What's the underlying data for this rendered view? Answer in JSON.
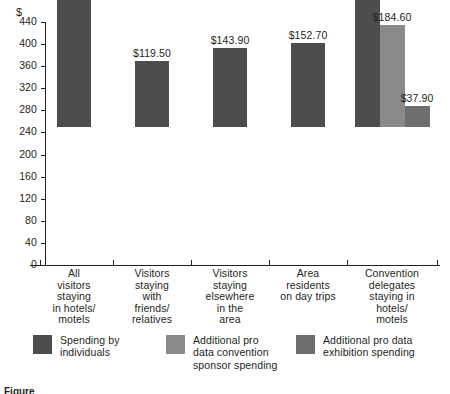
{
  "chart_data": {
    "type": "bar",
    "title": "",
    "xlabel": "",
    "ylabel": "$",
    "ylim": [
      0,
      440
    ],
    "ytick_step": 40,
    "grid": false,
    "legend_position": "bottom",
    "categories": [
      "All visitors staying in hotels/motels",
      "Visitors staying with friends/relatives",
      "Visitors staying elsewhere in the area",
      "Area residents on day trips",
      "Convention delegates staying in hotels/motels"
    ],
    "category_lines": [
      [
        "All",
        "visitors",
        "staying",
        "in hotels/",
        "motels"
      ],
      [
        "Visitors",
        "staying",
        "with",
        "friends/",
        "relatives"
      ],
      [
        "Visitors",
        "staying",
        "elsewhere",
        "in the",
        "area"
      ],
      [
        "Area",
        "residents",
        "on day trips"
      ],
      [
        "Convention",
        "delegates",
        "staying in",
        "hotels/",
        "motels"
      ]
    ],
    "series": [
      {
        "name": "Spending by individuals",
        "color": "#4d4d4d",
        "values": [
          320.45,
          119.5,
          143.9,
          152.7,
          423.6
        ],
        "labels": [
          "$320.45",
          "$119.50",
          "$143.90",
          "$152.70",
          "$423.60"
        ]
      },
      {
        "name": "Additional pro data convention sponsor spending",
        "color": "#8a8a8a",
        "values": [
          null,
          null,
          null,
          null,
          184.6
        ],
        "labels": [
          null,
          null,
          null,
          null,
          "$184.60"
        ]
      },
      {
        "name": "Additional pro data exhibition spending",
        "color": "#6e6e6e",
        "values": [
          null,
          null,
          null,
          null,
          37.9
        ],
        "labels": [
          null,
          null,
          null,
          null,
          "$37.90"
        ]
      }
    ],
    "ytick_labels": [
      "0",
      "40",
      "80",
      "120",
      "160",
      "200",
      "240",
      "280",
      "320",
      "360",
      "400",
      "440"
    ],
    "ytick_values": [
      0,
      40,
      80,
      120,
      160,
      200,
      240,
      280,
      320,
      360,
      400,
      440
    ]
  },
  "axis": {
    "unit_symbol": "$"
  },
  "legend": {
    "items": [
      {
        "label_lines": [
          "Spending by",
          "individuals"
        ],
        "color": "#4d4d4d"
      },
      {
        "label_lines": [
          "Additional pro",
          "data convention",
          "sponsor spending"
        ],
        "color": "#8a8a8a"
      },
      {
        "label_lines": [
          "Additional pro data",
          "exhibition spending"
        ],
        "color": "#6e6e6e"
      }
    ]
  },
  "caption": {
    "text": "Figure"
  }
}
